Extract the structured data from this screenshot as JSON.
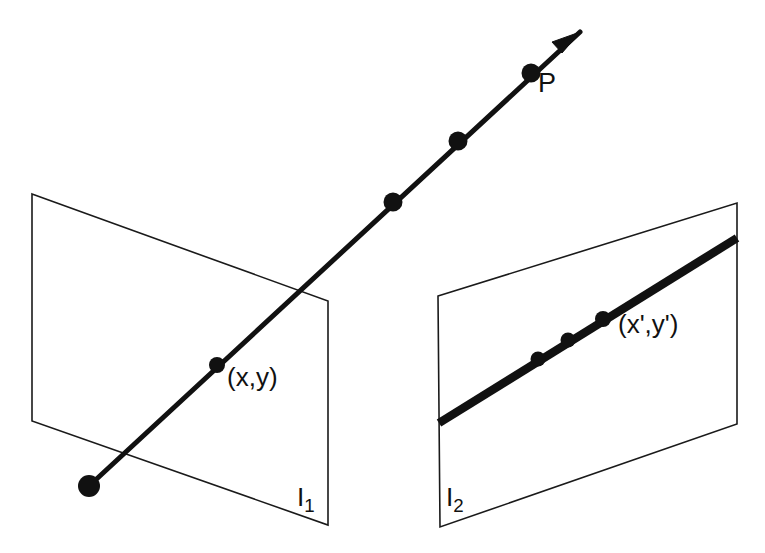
{
  "figure": {
    "background_color": "#ffffff",
    "ink_color": "#111111",
    "width": 765,
    "height": 553,
    "labels": {
      "point_P": "P",
      "image_point_1": "(x,y)",
      "image_point_2": "(x',y')",
      "plane_1_prefix": "I",
      "plane_1_subscript": "1",
      "plane_2_prefix": "I",
      "plane_2_subscript": "2"
    },
    "planes": [
      {
        "name": "I1",
        "label": "I1",
        "points": "32,194 328,301 328,525 32,421"
      },
      {
        "name": "I2",
        "label": "I2",
        "points": "438,296 737,203 737,424 440,527"
      }
    ],
    "ray": {
      "name": "scene-ray",
      "path": "M 89,486 L 580,32",
      "start": [
        89,
        486
      ],
      "end": [
        580,
        32
      ],
      "arrow_head": "580,32 552,42 562,53"
    },
    "image_line": {
      "name": "projected-line-in-plane-2",
      "path": "M 439,423 L 737,238",
      "start": [
        439,
        423
      ],
      "end": [
        737,
        238
      ]
    },
    "dots": [
      {
        "name": "ray-origin-dot",
        "cx": 89,
        "cy": 486,
        "r": 11
      },
      {
        "name": "image-point-xy-dot",
        "cx": 217,
        "cy": 365,
        "r": 8
      },
      {
        "name": "ray-dot-mid-lower",
        "cx": 393,
        "cy": 202,
        "r": 9.5
      },
      {
        "name": "ray-dot-mid-upper",
        "cx": 458,
        "cy": 141,
        "r": 9.5
      },
      {
        "name": "scene-point-P-dot",
        "cx": 531,
        "cy": 73,
        "r": 9.5
      },
      {
        "name": "image-line-dot-left",
        "cx": 538,
        "cy": 359,
        "r": 7.5
      },
      {
        "name": "image-line-dot-mid",
        "cx": 568,
        "cy": 340,
        "r": 7.5
      },
      {
        "name": "image-line-dot-right",
        "cx": 603,
        "cy": 319,
        "r": 8
      }
    ]
  }
}
